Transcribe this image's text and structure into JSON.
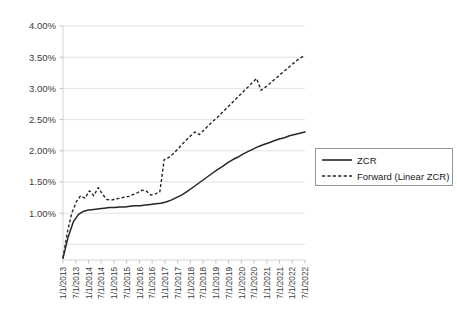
{
  "chart_data": {
    "type": "line",
    "title": "",
    "xlabel": "",
    "ylabel": "",
    "ylim": [
      0.0,
      4.0
    ],
    "ytick_labels": [
      "4.00%",
      "3.50%",
      "3.00%",
      "2.50%",
      "2.00%",
      "1.50%",
      "1.00%"
    ],
    "ytick_values": [
      4.0,
      3.5,
      3.0,
      2.5,
      2.0,
      1.5,
      1.0
    ],
    "grid": true,
    "legend_position": "right",
    "x": [
      "1/1/2013",
      "7/1/2013",
      "1/1/2014",
      "7/1/2014",
      "1/1/2015",
      "7/1/2015",
      "1/1/2016",
      "7/1/2016",
      "1/1/2017",
      "7/1/2017",
      "1/1/2018",
      "7/1/2018",
      "1/1/2019",
      "7/1/2019",
      "1/1/2020",
      "7/1/2020",
      "1/1/2021",
      "7/1/2021",
      "1/1/2022",
      "7/1/2022"
    ],
    "series": [
      {
        "name": "ZCR",
        "style": "solid",
        "color": "#262626",
        "values": [
          0.28,
          1.04,
          1.09,
          1.11,
          1.13,
          1.16,
          1.21,
          1.29,
          1.4,
          1.52,
          1.64,
          1.75,
          1.86,
          1.95,
          2.03,
          2.1,
          2.16,
          2.21,
          2.26,
          2.3
        ],
        "dense_values": [
          0.28,
          0.62,
          0.86,
          0.98,
          1.03,
          1.05,
          1.06,
          1.07,
          1.08,
          1.09,
          1.09,
          1.1,
          1.1,
          1.11,
          1.12,
          1.12,
          1.13,
          1.14,
          1.15,
          1.16,
          1.18,
          1.21,
          1.25,
          1.29,
          1.34,
          1.4,
          1.46,
          1.52,
          1.58,
          1.64,
          1.7,
          1.75,
          1.81,
          1.86,
          1.9,
          1.95,
          1.99,
          2.03,
          2.07,
          2.1,
          2.13,
          2.16,
          2.19,
          2.21,
          2.24,
          2.26,
          2.28,
          2.3
        ]
      },
      {
        "name": "Forward (Linear ZCR)",
        "style": "dashed",
        "color": "#262626",
        "values": [
          0.28,
          1.33,
          1.23,
          1.27,
          1.35,
          1.31,
          1.88,
          2.1,
          2.33,
          2.52,
          2.72,
          2.9,
          3.08,
          3.18,
          2.98,
          3.12,
          3.24,
          3.35,
          3.44,
          3.52
        ],
        "dense_values": [
          0.28,
          0.7,
          1.0,
          1.18,
          1.28,
          1.24,
          1.36,
          1.28,
          1.41,
          1.3,
          1.22,
          1.21,
          1.23,
          1.24,
          1.26,
          1.27,
          1.3,
          1.33,
          1.37,
          1.35,
          1.29,
          1.31,
          1.34,
          1.86,
          1.89,
          1.95,
          2.02,
          2.1,
          2.17,
          2.24,
          2.3,
          2.26,
          2.33,
          2.4,
          2.47,
          2.53,
          2.6,
          2.67,
          2.74,
          2.81,
          2.88,
          2.95,
          3.02,
          3.09,
          3.16,
          2.97,
          3.02,
          3.08,
          3.14,
          3.2,
          3.26,
          3.32,
          3.38,
          3.44,
          3.49,
          3.53
        ]
      }
    ],
    "legend_entries": [
      {
        "label": "ZCR",
        "style": "solid"
      },
      {
        "label": "Forward (Linear ZCR)",
        "style": "dashed"
      }
    ]
  }
}
